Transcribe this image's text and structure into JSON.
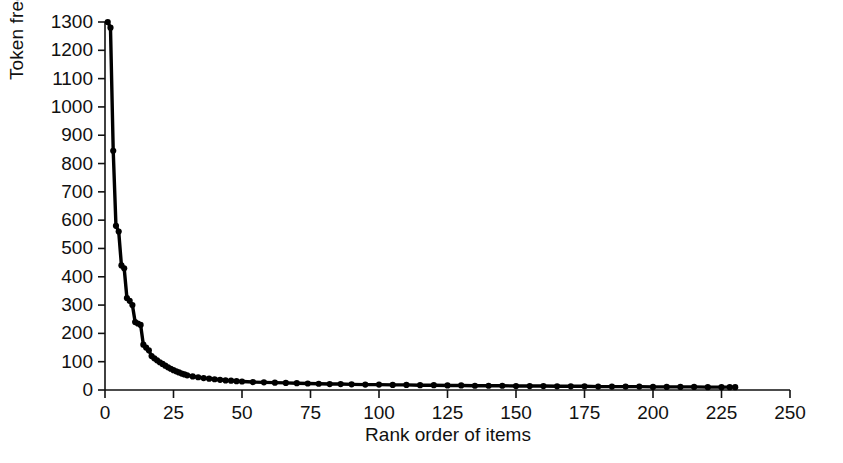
{
  "chart_data": {
    "type": "scatter",
    "title": "",
    "xlabel": "Rank order of items",
    "ylabel": "Token frequency",
    "xlim": [
      0,
      250
    ],
    "ylim": [
      0,
      1300
    ],
    "xticks": [
      0,
      25,
      50,
      75,
      100,
      125,
      150,
      175,
      200,
      225,
      250
    ],
    "yticks": [
      0,
      100,
      200,
      300,
      400,
      500,
      600,
      700,
      800,
      900,
      1000,
      1100,
      1200,
      1300
    ],
    "grid": false,
    "legend": null,
    "marker": "filled-circle",
    "fit_line": "power-law decay curve through points",
    "series": [
      {
        "name": "Token frequency by rank",
        "x": [
          1,
          2,
          3,
          4,
          5,
          6,
          7,
          8,
          9,
          10,
          11,
          12,
          13,
          14,
          15,
          16,
          17,
          18,
          19,
          20,
          21,
          22,
          23,
          24,
          25,
          26,
          27,
          28,
          29,
          30,
          32,
          34,
          36,
          38,
          40,
          42,
          44,
          46,
          48,
          50,
          54,
          58,
          62,
          66,
          70,
          74,
          78,
          82,
          86,
          90,
          95,
          100,
          105,
          110,
          115,
          120,
          125,
          130,
          135,
          140,
          145,
          150,
          155,
          160,
          165,
          170,
          175,
          180,
          185,
          190,
          195,
          200,
          205,
          210,
          215,
          220,
          225,
          228,
          230
        ],
        "y": [
          1300,
          1280,
          845,
          580,
          560,
          440,
          430,
          325,
          315,
          300,
          240,
          235,
          230,
          160,
          150,
          140,
          120,
          112,
          105,
          98,
          92,
          86,
          80,
          75,
          70,
          66,
          62,
          58,
          55,
          52,
          48,
          45,
          42,
          40,
          38,
          36,
          34,
          33,
          31,
          30,
          28,
          27,
          26,
          25,
          24,
          23,
          22,
          21,
          21,
          20,
          19,
          19,
          18,
          18,
          17,
          17,
          16,
          16,
          15,
          15,
          15,
          14,
          14,
          14,
          13,
          13,
          13,
          12,
          12,
          12,
          12,
          11,
          11,
          11,
          11,
          10,
          10,
          10,
          10
        ]
      }
    ]
  },
  "axes": {
    "y_tick_labels": [
      "1300",
      "1200",
      "1100",
      "1000",
      "900",
      "800",
      "700",
      "600",
      "500",
      "400",
      "300",
      "200",
      "100",
      "0"
    ],
    "x_tick_labels": [
      "0",
      "25",
      "50",
      "75",
      "100",
      "125",
      "150",
      "175",
      "200",
      "225",
      "250"
    ],
    "x_title": "Rank order of items",
    "y_title": "Token frequency"
  },
  "style": {
    "axis_color": "#111111",
    "marker_color": "#000000",
    "curve_color": "#000000",
    "background": "#ffffff"
  }
}
